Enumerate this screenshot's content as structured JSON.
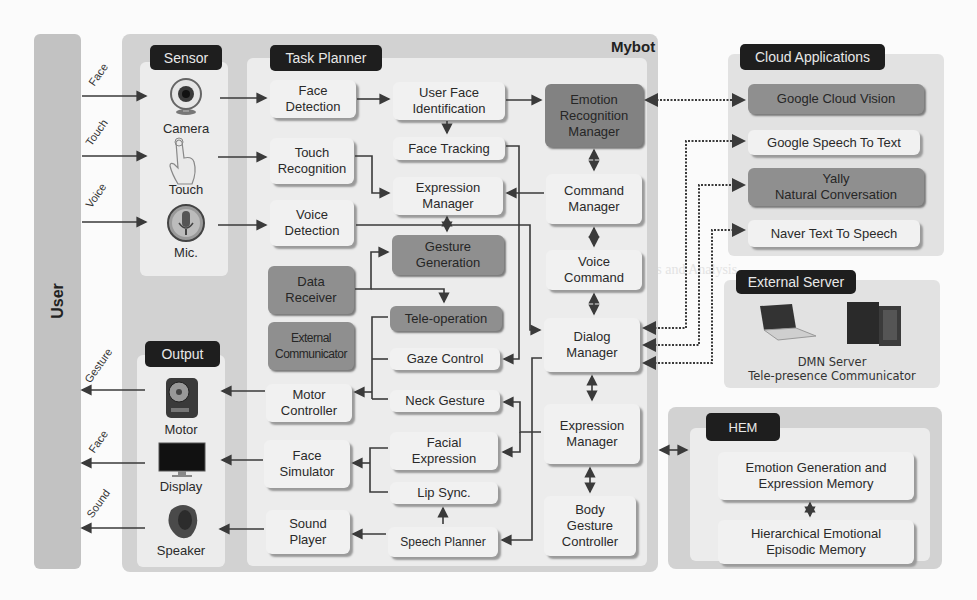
{
  "user": {
    "label": "User"
  },
  "inputs": [
    {
      "label": "Face"
    },
    {
      "label": "Touch"
    },
    {
      "label": "Voice"
    }
  ],
  "outputs_arrows": [
    {
      "label": "Gesture"
    },
    {
      "label": "Face"
    },
    {
      "label": "Sound"
    }
  ],
  "sensor": {
    "title": "Sensor",
    "devices": [
      {
        "label": "Camera",
        "icon": "camera-icon"
      },
      {
        "label": "Touch",
        "icon": "touch-icon"
      },
      {
        "label": "Mic.",
        "icon": "microphone-icon"
      }
    ]
  },
  "output": {
    "title": "Output",
    "devices": [
      {
        "label": "Motor",
        "icon": "motor-icon"
      },
      {
        "label": "Display",
        "icon": "display-icon"
      },
      {
        "label": "Speaker",
        "icon": "speaker-icon"
      }
    ]
  },
  "mybot": {
    "title": "Mybot"
  },
  "task_planner": {
    "title": "Task Planner",
    "left": {
      "face_detection": "Face\nDetection",
      "touch_recognition": "Touch\nRecognition",
      "voice_detection": "Voice\nDetection",
      "data_receiver": "Data\nReceiver",
      "external_communicator": "External\nCommunicator",
      "motor_controller": "Motor\nController",
      "face_simulator": "Face\nSimulator",
      "sound_player": "Sound\nPlayer"
    },
    "middle": {
      "user_face_identification": "User Face\nIdentification",
      "face_tracking": "Face Tracking",
      "expression_manager": "Expression\nManager",
      "gesture_generation": "Gesture\nGeneration",
      "tele_operation": "Tele-operation",
      "gaze_control": "Gaze Control",
      "neck_gesture": "Neck Gesture",
      "facial_expression": "Facial\nExpression",
      "lip_sync": "Lip Sync.",
      "speech_planner": "Speech Planner"
    }
  },
  "core": {
    "emotion_recognition_manager": "Emotion\nRecognition\nManager",
    "command_manager": "Command\nManager",
    "voice_command": "Voice\nCommand",
    "dialog_manager": "Dialog\nManager",
    "expression_manager": "Expression\nManager",
    "body_gesture_controller": "Body\nGesture\nController"
  },
  "cloud": {
    "title": "Cloud Applications",
    "items": [
      {
        "label": "Google Cloud Vision",
        "style": "dark"
      },
      {
        "label": "Google Speech To Text",
        "style": "light"
      },
      {
        "label": "Yally\nNatural Conversation",
        "style": "dark"
      },
      {
        "label": "Naver Text To Speech",
        "style": "light"
      }
    ]
  },
  "external_server": {
    "title": "External Server",
    "caption_line1": "DMN Server",
    "caption_line2": "Tele-presence Communicator"
  },
  "hem": {
    "title": "HEM",
    "items": [
      {
        "label": "Emotion Generation and\nExpression Memory"
      },
      {
        "label": "Hierarchical Emotional\nEpisodic Memory"
      }
    ]
  },
  "colors": {
    "panel": "#d2d2d2",
    "inner": "#ececec",
    "tag": "#1e1e1e",
    "box_light": "#f1f1f1",
    "box_dark": "#8f8f8f",
    "line": "#3a3a3a"
  }
}
